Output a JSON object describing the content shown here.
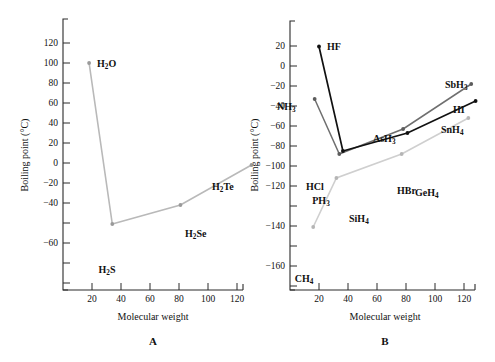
{
  "figure": {
    "panel_a_letter": "A",
    "panel_b_letter": "B"
  },
  "chart_data": [
    {
      "id": "panel-a",
      "type": "line",
      "title": "",
      "panel_label": "A",
      "xlabel": "Molecular weight",
      "ylabel": "Boiling point (°C)",
      "xlim": [
        0,
        140
      ],
      "ylim": [
        -72,
        132
      ],
      "xticks": [
        20,
        40,
        60,
        80,
        100,
        120
      ],
      "yticks": [
        120,
        100,
        80,
        60,
        40,
        20,
        0,
        -20,
        -40,
        -60
      ],
      "xticklabels": [
        "20",
        "40",
        "60",
        "80",
        "100",
        "120"
      ],
      "yticklabels": [
        "120",
        "100",
        "80",
        "60",
        "40",
        "20",
        "0",
        "−20",
        "−40",
        "−60"
      ],
      "grid": false,
      "legend": "none",
      "series": [
        {
          "name": "Group 16 hydrides",
          "color": "#b9b9b9",
          "marker_color": "#9a9a9a",
          "x": [
            18,
            34,
            81,
            130
          ],
          "y": [
            100,
            -61,
            -42,
            -2
          ],
          "point_labels": [
            "H2O",
            "H2S",
            "H2Se",
            "H2Te"
          ],
          "point_labels_html": [
            "H<sub>2</sub>O",
            "H<sub>2</sub>S",
            "H<sub>2</sub>Se",
            "H<sub>2</sub>Te"
          ]
        }
      ]
    },
    {
      "id": "panel-b",
      "type": "line",
      "title": "",
      "panel_label": "B",
      "xlabel": "Molecular weight",
      "ylabel": "Boiling point (°C)",
      "xlim": [
        0,
        140
      ],
      "ylim": [
        -172,
        30
      ],
      "xticks": [
        20,
        40,
        60,
        80,
        100,
        120
      ],
      "yticks": [
        20,
        0,
        -20,
        -40,
        -60,
        -80,
        -100,
        -120,
        -140,
        -160
      ],
      "xticklabels": [
        "20",
        "40",
        "60",
        "80",
        "100",
        "120"
      ],
      "yticklabels": [
        "20",
        "0",
        "−20",
        "−40",
        "−60",
        "−80",
        "−100",
        "−120",
        "−140",
        "−160"
      ],
      "grid": false,
      "legend": "none",
      "series": [
        {
          "name": "Group 17 hydrogen halides",
          "color": "#111111",
          "marker_color": "#111111",
          "x": [
            20,
            36.5,
            81,
            128
          ],
          "y": [
            19.5,
            -85,
            -67,
            -35
          ],
          "point_labels": [
            "HF",
            "HCl",
            "HBr",
            "HI"
          ],
          "point_labels_html": [
            "HF",
            "HCl",
            "HBr",
            "HI"
          ]
        },
        {
          "name": "Group 15 hydrides",
          "color": "#6f6f6f",
          "marker_color": "#5c5c5c",
          "x": [
            17,
            34,
            78,
            125
          ],
          "y": [
            -33,
            -88,
            -63,
            -18
          ],
          "point_labels": [
            "NH3",
            "PH3",
            "AsH3",
            "SbH3"
          ],
          "point_labels_html": [
            "NH<sub>3</sub>",
            "PH<sub>3</sub>",
            "AsH<sub>3</sub>",
            "SbH<sub>3</sub>"
          ]
        },
        {
          "name": "Group 14 hydrides",
          "color": "#cfcfcf",
          "marker_color": "#b5b5b5",
          "x": [
            16,
            32,
            77,
            123
          ],
          "y": [
            -161,
            -112,
            -88,
            -52
          ],
          "point_labels": [
            "CH4",
            "SiH4",
            "GeH4",
            "SnH4"
          ],
          "point_labels_html": [
            "CH<sub>4</sub>",
            "SiH<sub>4</sub>",
            "GeH<sub>4</sub>",
            "SnH<sub>4</sub>"
          ]
        }
      ],
      "label_offsets": {
        "HF": [
          9,
          -2
        ],
        "HCl": [
          -26,
          10
        ],
        "HBr": [
          -4,
          14
        ],
        "HI": [
          2,
          -8
        ],
        "NH3": [
          -32,
          -5
        ],
        "PH3": [
          -18,
          17
        ],
        "AsH3": [
          -20,
          -8
        ],
        "SbH3": [
          -6,
          -10
        ],
        "CH4": [
          -4,
          16
        ],
        "SiH4": [
          7,
          11
        ],
        "GeH4": [
          8,
          6
        ],
        "SnH4": [
          -6,
          -9
        ]
      }
    }
  ]
}
